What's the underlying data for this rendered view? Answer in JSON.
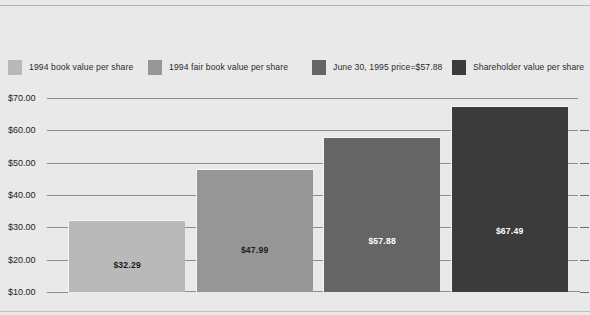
{
  "chart_data": {
    "type": "bar",
    "title": "",
    "subtitle": "",
    "xlabel": "",
    "ylabel": "",
    "ylim": [
      10,
      70
    ],
    "grid": true,
    "legend_position": "top",
    "categories": [
      "1994 book value per share",
      "1994 fair book value per share",
      "June 30, 1995 price=$57.88",
      "Shareholder value per share"
    ],
    "values": [
      32.29,
      47.99,
      57.88,
      67.49
    ],
    "value_labels": [
      "$32.29",
      "$47.99",
      "$57.88",
      "$67.49"
    ],
    "tick_labels": [
      "$70.00",
      "$60.00",
      "$50.00",
      "$40.00",
      "$30.00",
      "$20.00",
      "$10.00"
    ],
    "tick_values": [
      70,
      60,
      50,
      40,
      30,
      20,
      10
    ],
    "colors": [
      "#b9b9b9",
      "#969696",
      "#656565",
      "#3b3b3b"
    ],
    "label_colors": [
      "#1a1a1a",
      "#1a1a1a",
      "#ffffff",
      "#ffffff"
    ]
  },
  "legend": {
    "items": [
      {
        "label": "1994 book value per share",
        "color": "#b9b9b9"
      },
      {
        "label": "1994 fair book value per share",
        "color": "#969696"
      },
      {
        "label": "June 30, 1995 price=$57.88",
        "color": "#656565"
      },
      {
        "label": "Shareholder value per share",
        "color": "#3b3b3b"
      }
    ]
  },
  "figure": {
    "background_color": "#e9e9e9",
    "gridline_color": "#8e8e8e"
  }
}
